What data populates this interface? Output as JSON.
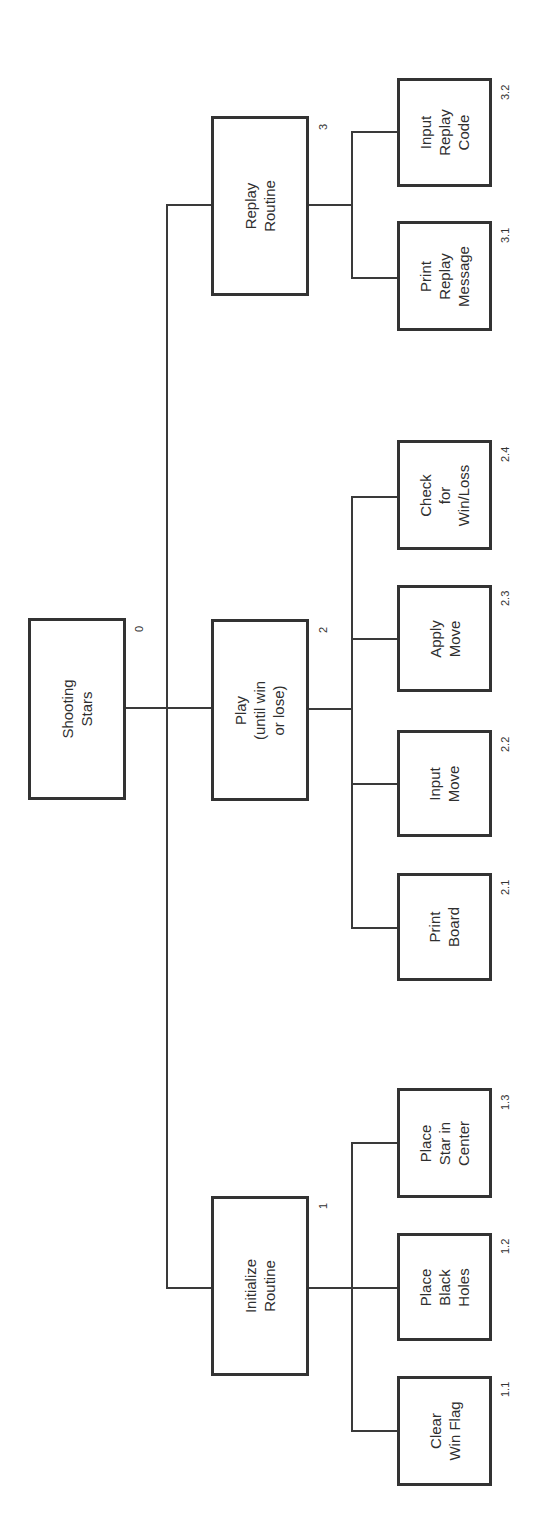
{
  "diagram": {
    "type": "hierarchy-chart",
    "orientation": "rotated-90-ccw",
    "root": {
      "id": "0",
      "label": "Shooting\nStars"
    },
    "modules": [
      {
        "id": "1",
        "label": "Initialize\nRoutine",
        "children": [
          {
            "id": "1.1",
            "label": "Clear\nWin Flag"
          },
          {
            "id": "1.2",
            "label": "Place\nBlack\nHoles"
          },
          {
            "id": "1.3",
            "label": "Place\nStar in\nCenter"
          }
        ]
      },
      {
        "id": "2",
        "label": "Play\n(until win\nor lose)",
        "children": [
          {
            "id": "2.1",
            "label": "Print\nBoard"
          },
          {
            "id": "2.2",
            "label": "Input\nMove"
          },
          {
            "id": "2.3",
            "label": "Apply\nMove"
          },
          {
            "id": "2.4",
            "label": "Check\nfor\nWin/Loss"
          }
        ]
      },
      {
        "id": "3",
        "label": "Replay\nRoutine",
        "children": [
          {
            "id": "3.1",
            "label": "Print\nReplay\nMessage"
          },
          {
            "id": "3.2",
            "label": "Input\nReplay\nCode"
          }
        ]
      }
    ]
  },
  "colors": {
    "line": "#3a3a3a",
    "box_border": "#333333",
    "background": "#ffffff"
  }
}
